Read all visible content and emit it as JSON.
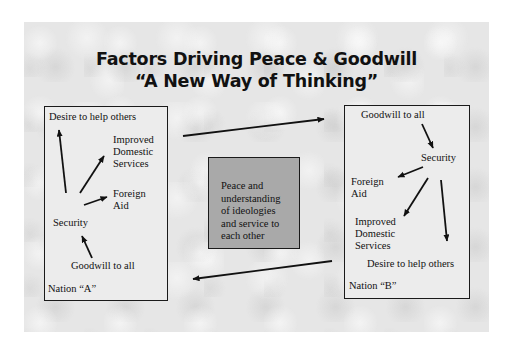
{
  "title": {
    "line1": "Factors Driving Peace & Goodwill",
    "line2": "“A New Way of Thinking”"
  },
  "nation_a": {
    "label": "Nation “A”",
    "nodes": {
      "desire": "Desire to help others",
      "improved_1": "Improved",
      "improved_2": "Domestic",
      "improved_3": "Services",
      "foreign_1": "Foreign",
      "foreign_2": "Aid",
      "security": "Security",
      "goodwill": "Goodwill to all"
    }
  },
  "nation_b": {
    "label": "Nation “B”",
    "nodes": {
      "goodwill": "Goodwill to all",
      "security": "Security",
      "foreign_1": "Foreign",
      "foreign_2": "Aid",
      "improved_1": "Improved",
      "improved_2": "Domestic",
      "improved_3": "Services",
      "desire": "Desire to help others"
    }
  },
  "center": {
    "text": "Peace and\nunderstanding\nof ideologies\nand service to\neach other",
    "fill": "#a9a9a9"
  },
  "colors": {
    "background": "#e6e6e6",
    "ink": "#111111"
  }
}
